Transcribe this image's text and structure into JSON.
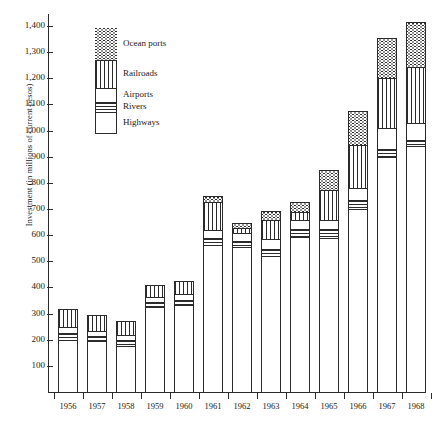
{
  "chart_data": {
    "type": "bar",
    "stacked": true,
    "title": "",
    "xlabel": "",
    "ylabel": "Investment (in millions of current pesos)",
    "ylim": [
      0,
      1450
    ],
    "ytick_labels": [
      "1,400",
      "1,300",
      "1,200",
      "1,100",
      "1,000",
      "900",
      "800",
      "700",
      "600",
      "500",
      "400",
      "300",
      "200",
      "100"
    ],
    "ytick_values": [
      1400,
      1300,
      1200,
      1100,
      1000,
      900,
      800,
      700,
      600,
      500,
      400,
      300,
      200,
      100
    ],
    "grid": false,
    "legend_position": "upper-left-inside",
    "categories": [
      "1956",
      "1957",
      "1958",
      "1959",
      "1960",
      "1961",
      "1962",
      "1963",
      "1964",
      "1965",
      "1966",
      "1967",
      "1968"
    ],
    "series": [
      {
        "name": "Highways",
        "pattern": "blank",
        "values": [
          205,
          200,
          180,
          330,
          340,
          570,
          560,
          525,
          600,
          595,
          705,
          905,
          945
        ]
      },
      {
        "name": "Rivers",
        "pattern": "horizontal",
        "values": [
          25,
          20,
          25,
          20,
          20,
          25,
          25,
          30,
          30,
          35,
          35,
          30,
          25
        ]
      },
      {
        "name": "Airports",
        "pattern": "stipple",
        "values": [
          25,
          20,
          20,
          20,
          20,
          30,
          30,
          35,
          35,
          35,
          45,
          80,
          65
        ]
      },
      {
        "name": "Ocean ports",
        "pattern": "wavy",
        "values": [
          0,
          0,
          0,
          0,
          0,
          20,
          15,
          30,
          35,
          75,
          130,
          150,
          170
        ]
      },
      {
        "name": "Railroads",
        "pattern": "vertical",
        "values": [
          65,
          60,
          50,
          45,
          50,
          110,
          20,
          75,
          30,
          115,
          165,
          195,
          215
        ]
      }
    ],
    "stack_order": [
      "Highways",
      "Rivers",
      "Airports",
      "Railroads",
      "Ocean ports"
    ],
    "totals": [
      320,
      300,
      275,
      415,
      430,
      755,
      650,
      695,
      730,
      855,
      1080,
      1360,
      1420
    ]
  },
  "legend": {
    "items": [
      {
        "label": "Ocean ports",
        "pattern": "wavy"
      },
      {
        "label": "Railroads",
        "pattern": "vertical"
      },
      {
        "label": "Airports",
        "pattern": "stipple"
      },
      {
        "label": "Rivers",
        "pattern": "horizontal"
      },
      {
        "label": "Highways",
        "pattern": "blank"
      }
    ]
  }
}
